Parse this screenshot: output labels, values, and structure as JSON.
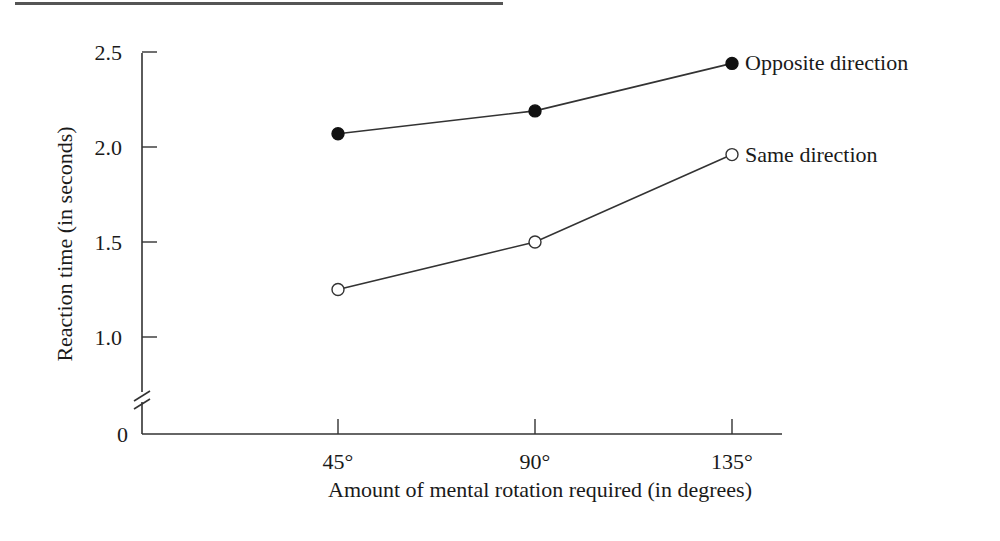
{
  "chart_data": {
    "type": "line",
    "title": "",
    "xlabel": "Amount of mental rotation required (in degrees)",
    "ylabel": "Reaction time (in seconds)",
    "categories": [
      "45°",
      "90°",
      "135°"
    ],
    "x": [
      45,
      90,
      135
    ],
    "series": [
      {
        "name": "Opposite direction",
        "marker": "filled-circle",
        "values": [
          2.07,
          2.19,
          2.44
        ]
      },
      {
        "name": "Same direction",
        "marker": "open-circle",
        "values": [
          1.25,
          1.5,
          1.96
        ]
      }
    ],
    "y_ticks": [
      "0",
      "1.0",
      "1.5",
      "2.0",
      "2.5"
    ],
    "ylim": [
      0,
      2.5
    ],
    "y_axis_break": true,
    "grid": false,
    "legend_position": "inline-right-of-last-point"
  },
  "colors": {
    "line": "#333333",
    "marker_fill": "#111111",
    "text": "#1a1a1a",
    "background": "#ffffff"
  }
}
